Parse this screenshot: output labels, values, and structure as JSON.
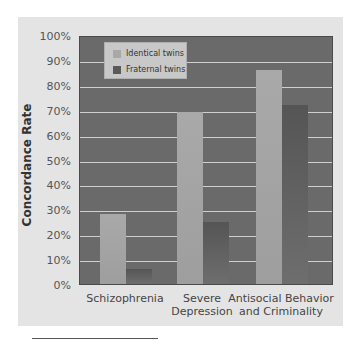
{
  "chart_data": {
    "type": "bar",
    "title": "",
    "xlabel": "",
    "ylabel": "Concordance Rate",
    "ylim": [
      0,
      100
    ],
    "yticks": [
      "0%",
      "10%",
      "20%",
      "30%",
      "40%",
      "50%",
      "60%",
      "70%",
      "80%",
      "90%",
      "100%"
    ],
    "grid": true,
    "legend_position": "top-left inside",
    "categories": [
      "Schizophrenia",
      "Severe Depression",
      "Antisocial Behavior and Criminality"
    ],
    "category_labels": [
      [
        "Schizophrenia"
      ],
      [
        "Severe",
        "Depression"
      ],
      [
        "Antisocial Behavior",
        "and Criminality"
      ]
    ],
    "series": [
      {
        "name": "Identical twins",
        "values": [
          28,
          69,
          86
        ],
        "color": "#a8a8a8"
      },
      {
        "name": "Fraternal twins",
        "values": [
          6,
          25,
          72
        ],
        "color": "#5a5a5a"
      }
    ]
  },
  "colors": {
    "panel": "#e4e4e4",
    "plot_background": "#6a6a6a",
    "gridline": "#cfcfcf",
    "identical": "#a8a8a8",
    "fraternal": "#5a5a5a"
  }
}
